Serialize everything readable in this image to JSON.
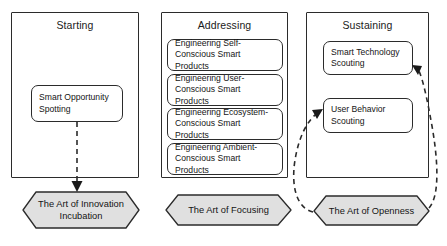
{
  "diagram": {
    "type": "process-flow",
    "colors": {
      "stroke": "#2b2b2b",
      "box_fill": "#ffffff",
      "hexagon_fill": "#e0e0e0",
      "text": "#141414",
      "canvas": "#ffffff"
    },
    "phases": [
      {
        "id": "starting",
        "title": "Starting",
        "activities": [
          {
            "id": "smart-opportunity-spotting",
            "label": "Smart Opportunity Spotting"
          }
        ],
        "outcome": {
          "id": "art-of-innovation-incubation",
          "label": "The Art of Innovation Incubation"
        }
      },
      {
        "id": "addressing",
        "title": "Addressing",
        "activities": [
          {
            "id": "engineering-self-conscious-smart-products",
            "label": "Engineering Self-Conscious Smart Products"
          },
          {
            "id": "engineering-user-conscious-smart-products",
            "label": "Engineering User-Conscious Smart Products"
          },
          {
            "id": "engineering-ecosystem-conscious-smart-products",
            "label": "Engineering Ecosystem-Conscious Smart Products"
          },
          {
            "id": "engineering-ambient-conscious-smart-products",
            "label": "Engineering Ambient-Conscious Smart Products"
          }
        ],
        "outcome": {
          "id": "art-of-focusing",
          "label": "The Art of Focusing"
        }
      },
      {
        "id": "sustaining",
        "title": "Sustaining",
        "activities": [
          {
            "id": "smart-technology-scouting",
            "label": "Smart Technology Scouting"
          },
          {
            "id": "user-behavior-scouting",
            "label": "User Behavior Scouting"
          }
        ],
        "outcome": {
          "id": "art-of-openness",
          "label": "The Art of Openness"
        }
      }
    ],
    "connectors": [
      {
        "id": "spotting-to-incubation",
        "style": "dashed",
        "arrow": "down",
        "from": "smart-opportunity-spotting",
        "to": "art-of-innovation-incubation"
      },
      {
        "id": "openness-to-user-behavior-scouting",
        "style": "dashed",
        "arrow": "up-right",
        "from": "art-of-openness",
        "to": "user-behavior-scouting"
      },
      {
        "id": "openness-to-smart-technology-scouting",
        "style": "dashed",
        "arrow": "up-left",
        "from": "art-of-openness",
        "to": "smart-technology-scouting"
      }
    ]
  }
}
